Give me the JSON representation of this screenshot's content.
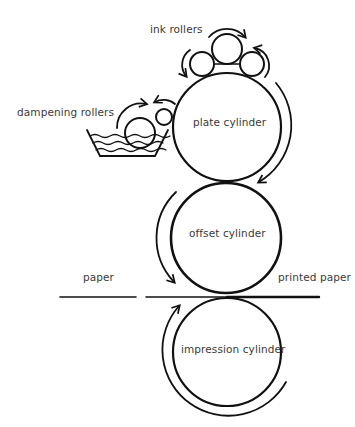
{
  "diagram": {
    "labels": {
      "ink_rollers": "ink rollers",
      "dampening_rollers": "dampening rollers",
      "plate_cylinder": "plate cylinder",
      "offset_cylinder": "offset cylinder",
      "impression_cylinder": "impression cylinder",
      "paper": "paper",
      "printed_paper": "printed paper"
    },
    "colors": {
      "stroke": "#111111",
      "text": "#3a3a3a",
      "background": "#ffffff"
    }
  }
}
